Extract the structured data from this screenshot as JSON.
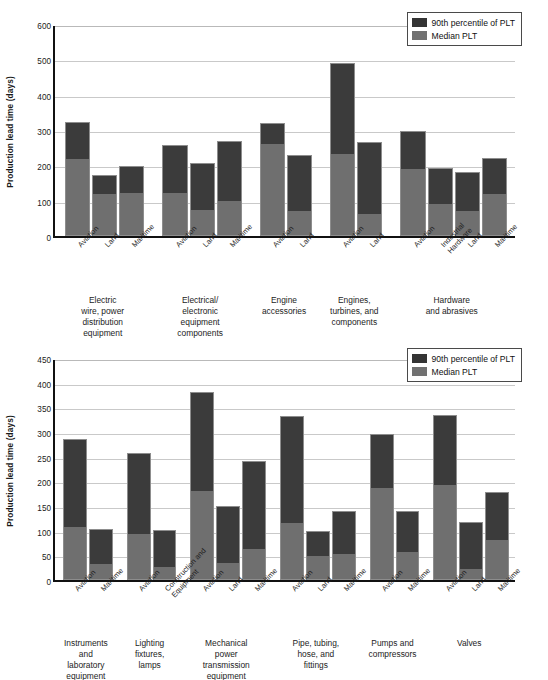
{
  "chart_data": [
    {
      "type": "bar",
      "stacked": true,
      "title": "",
      "xlabel": "",
      "ylabel": "Production lead time (days)",
      "ylim": [
        0,
        600
      ],
      "yticks": [
        0,
        100,
        200,
        300,
        400,
        500,
        600
      ],
      "grid": true,
      "legend_position": "top-right",
      "legend": [
        "90th percentile of PLT",
        "Median PLT"
      ],
      "series": [
        {
          "name": "Median PLT",
          "color": "#6f6f6f"
        },
        {
          "name": "90th percentile of PLT",
          "color": "#3b3b3b"
        }
      ],
      "groups": [
        {
          "label": "Electric wire, power distribution equipment",
          "label_lines": [
            "Electric",
            "wire, power",
            "distribution",
            "equipment"
          ],
          "bars": [
            {
              "category": "Aviation",
              "median": 215,
              "p90": 323
            },
            {
              "category": "Land",
              "median": 115,
              "p90": 173
            },
            {
              "category": "Maritime",
              "median": 118,
              "p90": 199
            }
          ]
        },
        {
          "label": "Electrical/electronic equipment components",
          "label_lines": [
            "Electrical/",
            "electronic",
            "equipment",
            "components"
          ],
          "bars": [
            {
              "category": "Aviation",
              "median": 118,
              "p90": 257
            },
            {
              "category": "Land",
              "median": 70,
              "p90": 208
            },
            {
              "category": "Maritime",
              "median": 95,
              "p90": 269
            }
          ]
        },
        {
          "label": "Engine accessories",
          "label_lines": [
            "Engine",
            "accessories"
          ],
          "bars": [
            {
              "category": "Aviation",
              "median": 258,
              "p90": 320
            },
            {
              "category": "Land",
              "median": 68,
              "p90": 230
            }
          ]
        },
        {
          "label": "Engines, turbines, and components",
          "label_lines": [
            "Engines,",
            "turbines, and",
            "components"
          ],
          "bars": [
            {
              "category": "Aviation",
              "median": 228,
              "p90": 490
            },
            {
              "category": "Land",
              "median": 60,
              "p90": 265
            }
          ]
        },
        {
          "label": "Hardware and abrasives",
          "label_lines": [
            "Hardware",
            "and abrasives"
          ],
          "bars": [
            {
              "category": "Aviation",
              "median": 188,
              "p90": 298
            },
            {
              "category": "Industrial Hardware",
              "category_lines": [
                "Industrial",
                "Hardware"
              ],
              "median": 88,
              "p90": 193
            },
            {
              "category": "Land",
              "median": 68,
              "p90": 181
            },
            {
              "category": "Maritime",
              "median": 115,
              "p90": 221
            }
          ]
        }
      ]
    },
    {
      "type": "bar",
      "stacked": true,
      "title": "",
      "xlabel": "",
      "ylabel": "Production lead time (days)",
      "ylim": [
        0,
        450
      ],
      "yticks": [
        0,
        50,
        100,
        150,
        200,
        250,
        300,
        350,
        400,
        450
      ],
      "grid": true,
      "legend_position": "top-right",
      "legend": [
        "90th percentile of PLT",
        "Median PLT"
      ],
      "series": [
        {
          "name": "Median PLT",
          "color": "#6f6f6f"
        },
        {
          "name": "90th percentile of PLT",
          "color": "#3b3b3b"
        }
      ],
      "groups": [
        {
          "label": "Instruments and laboratory equipment",
          "label_lines": [
            "Instruments",
            "and",
            "laboratory",
            "equipment"
          ],
          "bars": [
            {
              "category": "Aviation",
              "median": 105,
              "p90": 285
            },
            {
              "category": "Maritime",
              "median": 30,
              "p90": 103
            }
          ]
        },
        {
          "label": "Lighting fixtures, lamps",
          "label_lines": [
            "Lighting",
            "fixtures,",
            "lamps"
          ],
          "bars": [
            {
              "category": "Aviation",
              "median": 92,
              "p90": 257
            },
            {
              "category": "Construction and Equipment",
              "category_lines": [
                "Construction and",
                "Equipment"
              ],
              "median": 25,
              "p90": 102
            }
          ]
        },
        {
          "label": "Mechanical power transmission equipment",
          "label_lines": [
            "Mechanical",
            "power",
            "transmission",
            "equipment"
          ],
          "bars": [
            {
              "category": "Aviation",
              "median": 178,
              "p90": 382
            },
            {
              "category": "Land",
              "median": 33,
              "p90": 151
            },
            {
              "category": "Maritime",
              "median": 60,
              "p90": 241
            }
          ]
        },
        {
          "label": "Pipe, tubing, hose, and fittings",
          "label_lines": [
            "Pipe, tubing,",
            "hose, and",
            "fittings"
          ],
          "bars": [
            {
              "category": "Aviation",
              "median": 113,
              "p90": 333
            },
            {
              "category": "Land",
              "median": 47,
              "p90": 100
            },
            {
              "category": "Maritime",
              "median": 50,
              "p90": 139
            }
          ]
        },
        {
          "label": "Pumps and compressors",
          "label_lines": [
            "Pumps and",
            "compressors"
          ],
          "bars": [
            {
              "category": "Aviation",
              "median": 185,
              "p90": 295
            },
            {
              "category": "Maritime",
              "median": 55,
              "p90": 139
            }
          ]
        },
        {
          "label": "Valves",
          "label_lines": [
            "Valves"
          ],
          "bars": [
            {
              "category": "Aviation",
              "median": 190,
              "p90": 335
            },
            {
              "category": "Land",
              "median": 20,
              "p90": 117
            },
            {
              "category": "Maritime",
              "median": 80,
              "p90": 178
            }
          ]
        }
      ]
    }
  ],
  "colors": {
    "p90": "#3b3b3b",
    "median": "#6f6f6f",
    "axis": "#111111",
    "grid": "#c9c9c9",
    "text": "#1a1a1a",
    "background": "#ffffff"
  }
}
